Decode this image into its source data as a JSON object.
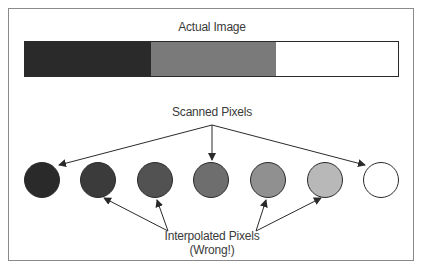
{
  "diagram": {
    "title": "Actual Image",
    "actual_image_segments": [
      {
        "name": "dark",
        "color": "#2a2a2a"
      },
      {
        "name": "gray",
        "color": "#7a7a7a"
      },
      {
        "name": "white",
        "color": "#ffffff"
      }
    ],
    "scanned_label": "Scanned Pixels",
    "interpolated_label": "Interpolated Pixels",
    "interpolated_note": "(Wrong!)",
    "pixels": [
      {
        "index": 1,
        "type": "scanned",
        "color": "#2a2a2a"
      },
      {
        "index": 2,
        "type": "interpolated",
        "color": "#3b3b3b"
      },
      {
        "index": 3,
        "type": "interpolated",
        "color": "#525252"
      },
      {
        "index": 4,
        "type": "scanned",
        "color": "#6e6e6e"
      },
      {
        "index": 5,
        "type": "interpolated",
        "color": "#909090"
      },
      {
        "index": 6,
        "type": "interpolated",
        "color": "#b8b8b8"
      },
      {
        "index": 7,
        "type": "scanned",
        "color": "#ffffff"
      }
    ]
  }
}
